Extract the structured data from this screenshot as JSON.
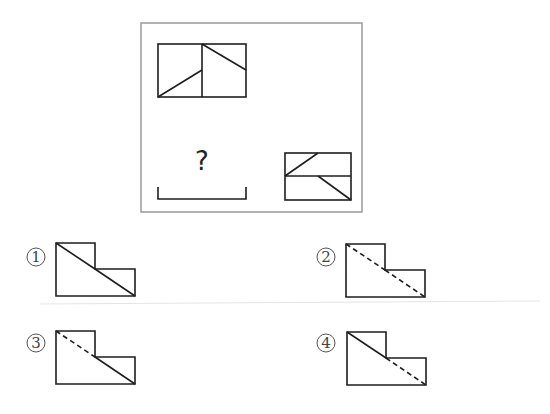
{
  "question": {
    "frame": {
      "x": 141,
      "y": 23,
      "w": 221,
      "h": 189,
      "border_color": "#9a9a9a"
    },
    "view_front": {
      "label": "top-left view",
      "rect": {
        "x": 158,
        "y": 44,
        "w": 88,
        "h": 53
      },
      "divider_x": 202,
      "lines": [
        {
          "x1": 158,
          "y1": 97,
          "x2": 202,
          "y2": 70
        },
        {
          "x1": 202,
          "y1": 44,
          "x2": 246,
          "y2": 70
        }
      ]
    },
    "view_side": {
      "label": "bottom-right view",
      "rect": {
        "x": 285,
        "y": 153,
        "w": 66,
        "h": 47
      },
      "divider_y": 176,
      "lines": [
        {
          "x1": 285,
          "y1": 176,
          "x2": 318,
          "y2": 153
        },
        {
          "x1": 318,
          "y1": 176,
          "x2": 351,
          "y2": 200
        }
      ]
    },
    "unknown_view": {
      "mark": "?",
      "bracket": {
        "x1": 158,
        "x2": 246,
        "y_bottom": 199,
        "y_top": 187
      }
    }
  },
  "options": [
    {
      "number": "①",
      "label_pos": {
        "x": 26,
        "y": 256
      },
      "origin": {
        "x": 56,
        "y": 243
      },
      "diag_upper": "solid",
      "diag_lower": "solid"
    },
    {
      "number": "②",
      "label_pos": {
        "x": 316,
        "y": 256
      },
      "origin": {
        "x": 346,
        "y": 244
      },
      "diag_upper": "dashed",
      "diag_lower": "dashed"
    },
    {
      "number": "③",
      "label_pos": {
        "x": 26,
        "y": 342
      },
      "origin": {
        "x": 56,
        "y": 331
      },
      "diag_upper": "dashed",
      "diag_lower": "solid"
    },
    {
      "number": "④",
      "label_pos": {
        "x": 316,
        "y": 342
      },
      "origin": {
        "x": 347,
        "y": 332
      },
      "diag_upper": "solid",
      "diag_lower": "dashed"
    }
  ],
  "option_shape": {
    "width": 79,
    "height": 53,
    "step_x": 39,
    "step_y": 26
  }
}
